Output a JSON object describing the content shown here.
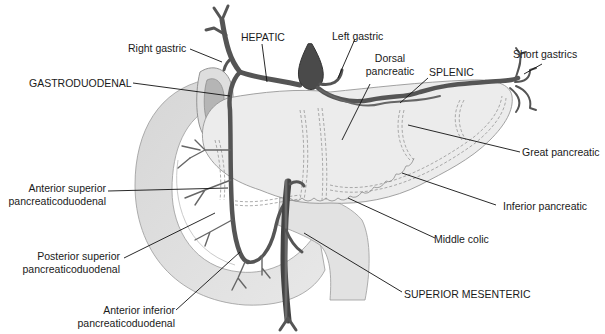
{
  "figure": {
    "colors": {
      "background": "#ffffff",
      "organ_fill": "#ebebeb",
      "duodenum_fill": "#dcdcdc",
      "vessel": "#555555",
      "vessel_dark": "#333333",
      "leader_line": "#111111",
      "label_text": "#1a1a1a"
    }
  },
  "labels": {
    "right_gastric": "Right gastric",
    "hepatic": "HEPATIC",
    "left_gastric": "Left gastric",
    "dorsal_pancreatic_1": "Dorsal",
    "dorsal_pancreatic_2": "pancreatic",
    "splenic": "SPLENIC",
    "short_gastrics": "Short gastrics",
    "gastroduodenal": "GASTRODUODENAL",
    "great_pancreatic": "Great pancreatic",
    "anterior_superior_1": "Anterior superior",
    "anterior_superior_2": "pancreaticoduodenal",
    "inferior_pancreatic": "Inferior pancreatic",
    "posterior_superior_1": "Posterior superior",
    "posterior_superior_2": "pancreaticoduodenal",
    "middle_colic": "Middle colic",
    "superior_mesenteric": "SUPERIOR MESENTERIC",
    "anterior_inferior_1": "Anterior inferior",
    "anterior_inferior_2": "pancreaticoduodenal"
  }
}
